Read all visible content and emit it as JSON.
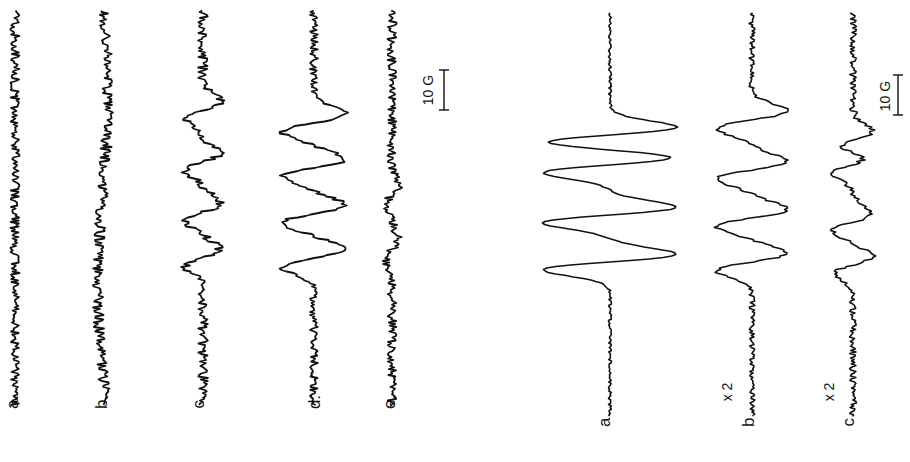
{
  "chart_data": [
    {
      "type": "line",
      "panel": "left",
      "orientation": "rotated -90deg (field axis runs vertically)",
      "title": "",
      "xlabel": "Magnetic field",
      "ylabel": "",
      "series": [
        {
          "name": "a.",
          "description": "noise only, no resolved signal"
        },
        {
          "name": "b.",
          "description": "noise only, no resolved signal"
        },
        {
          "name": "c.",
          "description": "weak 4-line pattern above noise"
        },
        {
          "name": "d.",
          "description": "clear 4-line pattern"
        },
        {
          "name": "e.",
          "description": "very weak signal, mostly noise"
        }
      ],
      "scale_bar": "10 G"
    },
    {
      "type": "line",
      "panel": "right",
      "orientation": "rotated -90deg (field axis runs vertically)",
      "title": "",
      "xlabel": "Magnetic field",
      "ylabel": "",
      "series": [
        {
          "name": "a.",
          "gain": "",
          "description": "strong 4-line spectrum"
        },
        {
          "name": "b.",
          "gain": "x 2",
          "description": "4-line spectrum, reduced intensity"
        },
        {
          "name": "c.",
          "gain": "x 2",
          "description": "weaker 4-line spectrum"
        }
      ],
      "scale_bar": "10 G"
    }
  ],
  "left": {
    "labels": [
      "a.",
      "b.",
      "c.",
      "d.",
      "e."
    ],
    "scale_label": "10 G"
  },
  "right": {
    "labels": [
      "a.",
      "b.",
      "c."
    ],
    "gains": [
      "",
      "x 2",
      "x 2"
    ],
    "scale_label": "10 G"
  }
}
